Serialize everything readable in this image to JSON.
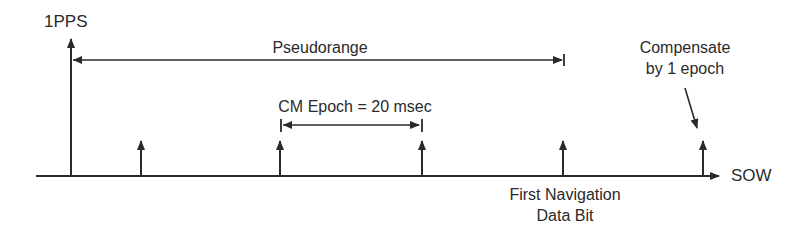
{
  "diagram": {
    "title": "",
    "stroke_color": "#2a2a2a",
    "labels": {
      "pps": "1PPS",
      "pseudorange": "Pseudorange",
      "cm_epoch": "CM Epoch = 20 msec",
      "compensate_line1": "Compensate",
      "compensate_line2": "by 1 epoch",
      "sow": "SOW",
      "first_nav_line1": "First Navigation",
      "first_nav_line2": "Data Bit"
    },
    "timeline": {
      "axis_label": "SOW",
      "epoch_markers": 6,
      "epoch_interval": "20 msec"
    }
  }
}
